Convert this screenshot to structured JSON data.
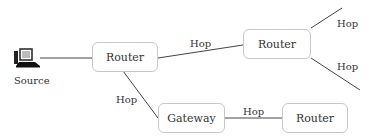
{
  "source": {
    "label": "Source",
    "icon": "computer-icon"
  },
  "nodes": [
    {
      "id": "router1",
      "label": "Router"
    },
    {
      "id": "router2",
      "label": "Router"
    },
    {
      "id": "gateway",
      "label": "Gateway"
    },
    {
      "id": "router3",
      "label": "Router"
    }
  ],
  "edges": [
    {
      "from": "source",
      "to": "router1",
      "label": ""
    },
    {
      "from": "router1",
      "to": "router2",
      "label": "Hop"
    },
    {
      "from": "router1",
      "to": "gateway",
      "label": "Hop"
    },
    {
      "from": "gateway",
      "to": "router3",
      "label": "Hop"
    },
    {
      "from": "router2",
      "to": "out-upper",
      "label": "Hop"
    },
    {
      "from": "router2",
      "to": "out-lower",
      "label": "Hop"
    }
  ],
  "colors": {
    "line": "#444444",
    "border": "#c8c8c8",
    "text": "#333333"
  }
}
